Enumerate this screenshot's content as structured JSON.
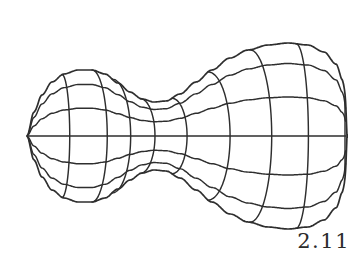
{
  "figure": {
    "label": "2.11",
    "caption_number": "2.11",
    "kind": "wireframe-surface-of-revolution",
    "background_color": "#ffffff",
    "line_color": "#2e2e2e",
    "line_width": 1.45
  },
  "geometry": {
    "canvas": {
      "width": 364,
      "height": 258
    },
    "pole": {
      "x": 27,
      "y": 136
    },
    "axis_y": 136,
    "profile_note": "half-width (radius) of the surface of revolution sampled along x",
    "profile": [
      {
        "x": 27,
        "r": 0
      },
      {
        "x": 34,
        "r": 24
      },
      {
        "x": 42,
        "r": 41
      },
      {
        "x": 52,
        "r": 54
      },
      {
        "x": 64,
        "r": 62
      },
      {
        "x": 78,
        "r": 66
      },
      {
        "x": 92,
        "r": 66
      },
      {
        "x": 105,
        "r": 62
      },
      {
        "x": 118,
        "r": 53
      },
      {
        "x": 130,
        "r": 44
      },
      {
        "x": 142,
        "r": 37
      },
      {
        "x": 154,
        "r": 34
      },
      {
        "x": 166,
        "r": 35
      },
      {
        "x": 180,
        "r": 42
      },
      {
        "x": 196,
        "r": 54
      },
      {
        "x": 212,
        "r": 66
      },
      {
        "x": 230,
        "r": 78
      },
      {
        "x": 248,
        "r": 86
      },
      {
        "x": 268,
        "r": 91
      },
      {
        "x": 288,
        "r": 93
      },
      {
        "x": 308,
        "r": 91
      },
      {
        "x": 324,
        "r": 84
      },
      {
        "x": 336,
        "r": 72
      },
      {
        "x": 343,
        "r": 55
      },
      {
        "x": 346,
        "r": 34
      },
      {
        "x": 347,
        "r": 0
      }
    ],
    "longitude_lines": {
      "count": 9,
      "label": "meridian curves running top-to-bottom",
      "x_positions": [
        27,
        62,
        92,
        112,
        140,
        172,
        208,
        250,
        296,
        345
      ],
      "bulge_factors": [
        0,
        0.3,
        0.55,
        0.78,
        0.95,
        0.95,
        0.82,
        0.6,
        0.32,
        0.0
      ]
    },
    "latitude_lines": {
      "count": 5,
      "label": "parallel curves running left-to-right",
      "v_levels": [
        -0.78,
        -0.42,
        0.0,
        0.42,
        0.78
      ]
    }
  }
}
